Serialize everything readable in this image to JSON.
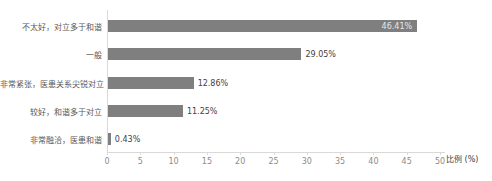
{
  "chart_data": {
    "type": "bar",
    "orientation": "horizontal",
    "title": "",
    "categories": [
      "不太好，对立多于和谐",
      "一般",
      "非常紧张，医患关系尖锐对立",
      "较好，和谐多于对立",
      "非常融洽，医患和谐"
    ],
    "values": [
      46.41,
      29.05,
      12.86,
      11.25,
      0.43
    ],
    "value_labels": [
      "46.41%",
      "29.05%",
      "12.86%",
      "11.25%",
      "0.43%"
    ],
    "xlabel": "比例 (%)",
    "xlim": [
      0,
      50
    ],
    "xticks": [
      0,
      5,
      10,
      15,
      20,
      25,
      30,
      35,
      40,
      45,
      50
    ],
    "grid": false,
    "legend": false,
    "colors": {
      "bar": "#7f7f7f",
      "value_label_inside": "#e6e6e6",
      "value_label_outside": "#3f3f3f",
      "axis_line": "#d9d9d9",
      "tick_label": "#8c8c8c",
      "category_label": "#595959",
      "xlabel_color": "#404040",
      "background": "#ffffff"
    }
  }
}
